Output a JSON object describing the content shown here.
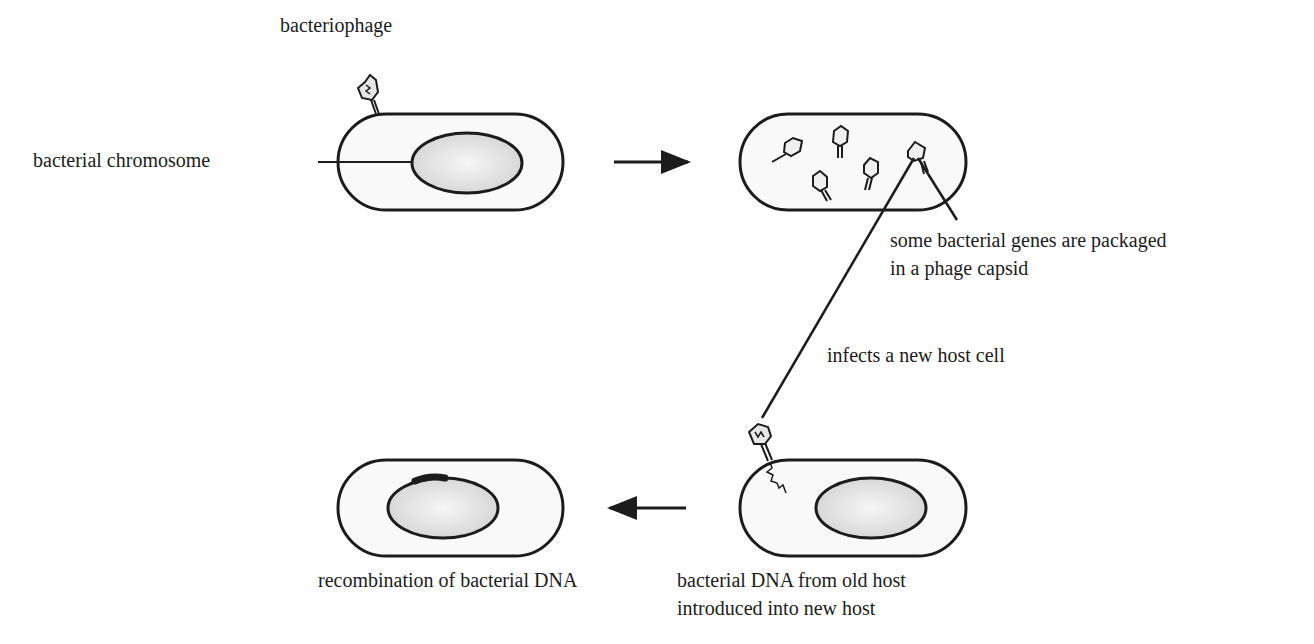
{
  "labels": {
    "bacteriophage": "bacteriophage",
    "bacterial_chromosome": "bacterial chromosome",
    "packaged_line1": "some bacterial genes are packaged",
    "packaged_line2": "in a phage capsid",
    "infects": "infects a new host cell",
    "recombination": "recombination of bacterial DNA",
    "introduced_line1": "bacterial DNA from old host",
    "introduced_line2": "introduced into new host"
  },
  "steps": [
    {
      "id": 1,
      "description": "phage attaches to bacterium"
    },
    {
      "id": 2,
      "description": "phages assembled in host; some carry bacterial genes"
    },
    {
      "id": 3,
      "description": "phage injects bacterial DNA into new host"
    },
    {
      "id": 4,
      "description": "recombination of bacterial DNA"
    }
  ],
  "colors": {
    "stroke": "#1c1c1c",
    "cell_fill": "#f9f9f9",
    "nucleoid_fill": "#e2e2e2",
    "background": "#ffffff"
  }
}
